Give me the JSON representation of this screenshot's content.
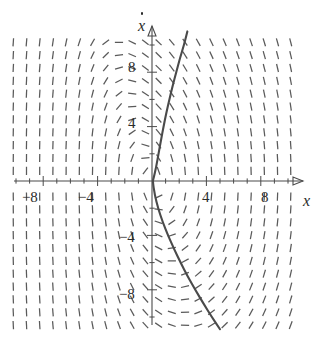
{
  "figure": {
    "kind": "direction-field-phase-plane",
    "background_color": "#ffffff",
    "stroke_color": "#4a4a4a",
    "field_color": "#5a5a5a"
  },
  "axes": {
    "x_axis": {
      "label": "x",
      "arrow": true,
      "tick_labels": [
        {
          "text": "−8",
          "value": -8
        },
        {
          "text": "−4",
          "value": -4
        },
        {
          "text": "4",
          "value": 4
        },
        {
          "text": "8",
          "value": 8
        }
      ]
    },
    "y_axis": {
      "label": "x",
      "label_has_dot": true,
      "label_display": "ẋ",
      "arrow": true,
      "tick_labels": [
        {
          "text": "8",
          "value": 8
        },
        {
          "text": "4",
          "value": 4
        },
        {
          "text": "−4",
          "value": -4
        },
        {
          "text": "−8",
          "value": -8
        }
      ]
    }
  },
  "chart_data": {
    "type": "line",
    "title": "",
    "xlabel": "x",
    "ylabel": "ẋ",
    "xlim": [
      -11.0,
      11.5
    ],
    "ylim": [
      -11.5,
      11.0
    ],
    "grid": false,
    "legend": null,
    "x_ticks": [
      -10,
      -9,
      -8,
      -7,
      -6,
      -5,
      -4,
      -3,
      -2,
      -1,
      0,
      1,
      2,
      3,
      4,
      5,
      6,
      7,
      8,
      9,
      10
    ],
    "y_ticks": [
      -10,
      -8,
      -6,
      -4,
      -2,
      0,
      2,
      4,
      6,
      8,
      10
    ],
    "x_major_ticks": [
      -8,
      -4,
      4,
      8
    ],
    "y_major_ticks": [
      -8,
      -4,
      4,
      8
    ],
    "series": [
      {
        "name": "trajectory",
        "description": "solution curve through the origin, steeply rising to upper right and falling to lower right",
        "points": [
          [
            2.6,
            11.0
          ],
          [
            2.35,
            10.0
          ],
          [
            2.05,
            9.0
          ],
          [
            1.78,
            8.0
          ],
          [
            1.52,
            7.0
          ],
          [
            1.28,
            6.0
          ],
          [
            1.05,
            5.0
          ],
          [
            0.85,
            4.0
          ],
          [
            0.66,
            3.0
          ],
          [
            0.48,
            2.0
          ],
          [
            0.3,
            1.0
          ],
          [
            0.12,
            0.2
          ],
          [
            0.05,
            0.0
          ],
          [
            0.2,
            -1.0
          ],
          [
            0.45,
            -2.0
          ],
          [
            0.78,
            -3.0
          ],
          [
            1.18,
            -4.0
          ],
          [
            1.62,
            -5.0
          ],
          [
            2.1,
            -6.0
          ],
          [
            2.62,
            -7.0
          ],
          [
            3.18,
            -8.0
          ],
          [
            3.78,
            -9.0
          ],
          [
            4.4,
            -10.0
          ],
          [
            5.0,
            -10.9
          ]
        ]
      }
    ],
    "vector_field": {
      "description": "grid of short line segments showing slope directions; nearly vertical at left, tilting toward horizontal near the vertical axis and in the right half",
      "x_range": [
        -10.2,
        10.2
      ],
      "y_range": [
        -10.6,
        10.2
      ],
      "nx": 21,
      "ny": 22
    }
  }
}
